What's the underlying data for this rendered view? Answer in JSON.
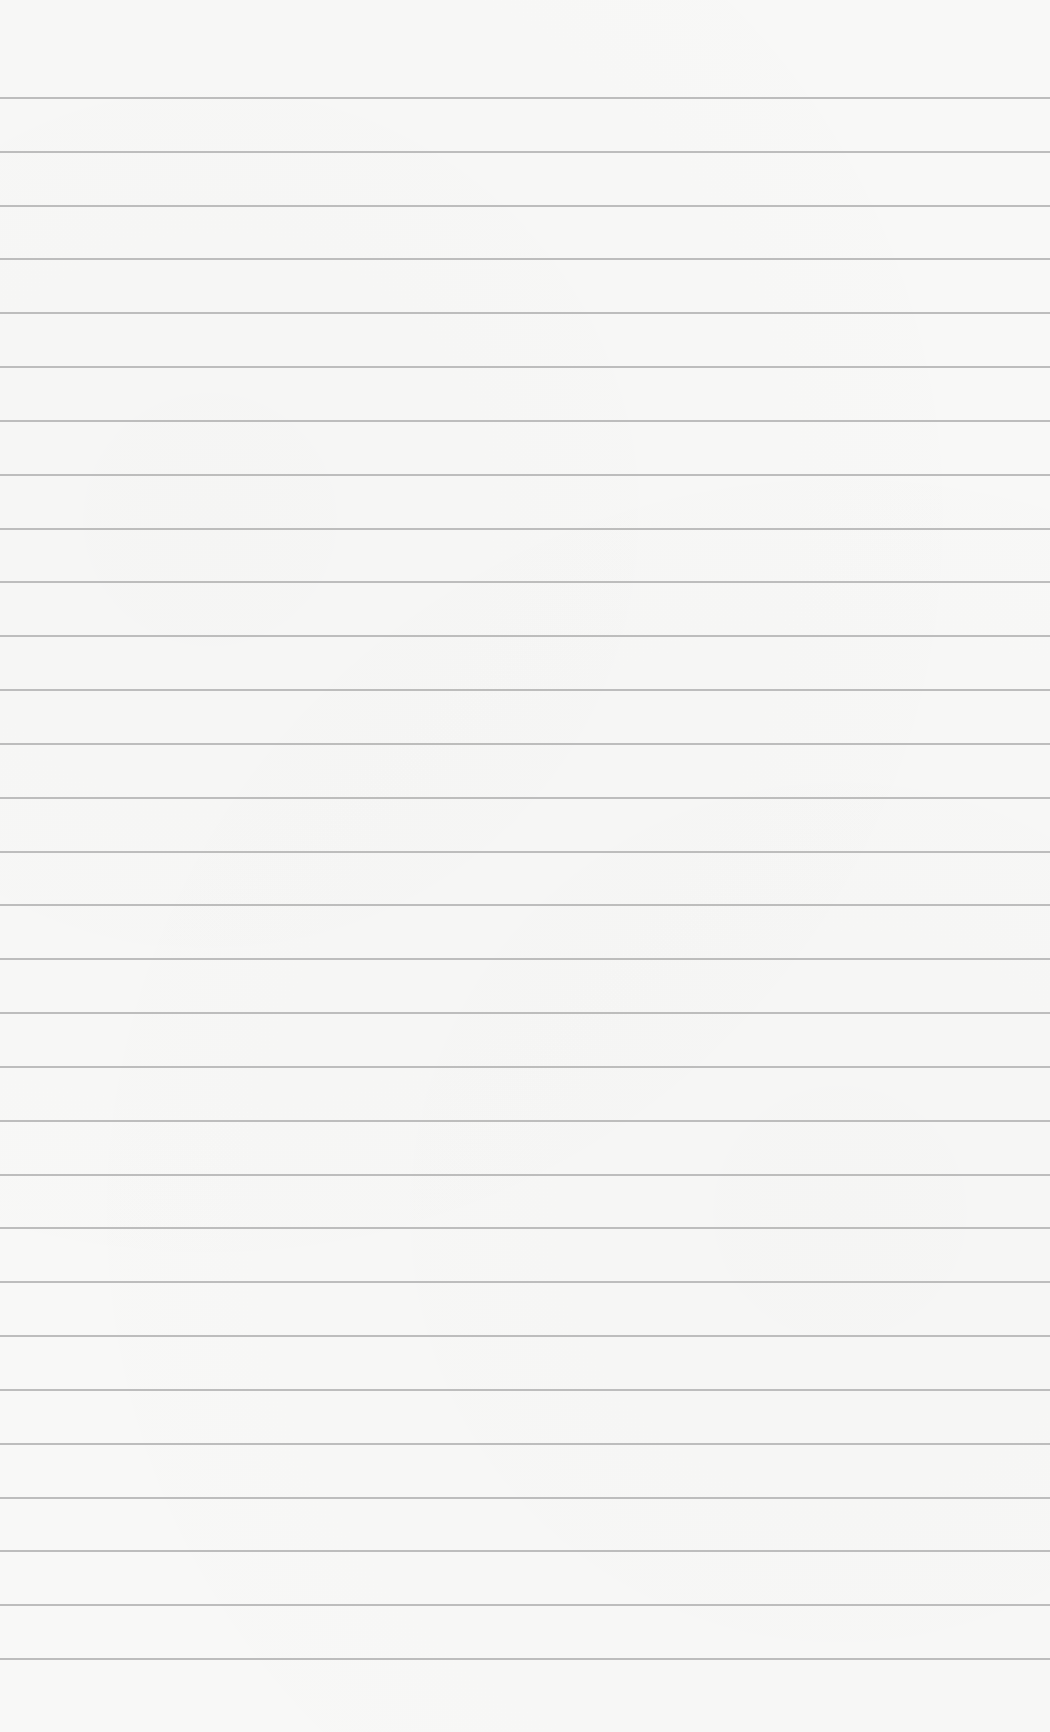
{
  "page": {
    "type": "blank ruled paper",
    "background_color": "#f8f8f7",
    "rule_color": "#a9a9a9",
    "rule_count": 30,
    "first_rule_y": 97,
    "rule_spacing": 53.83
  }
}
